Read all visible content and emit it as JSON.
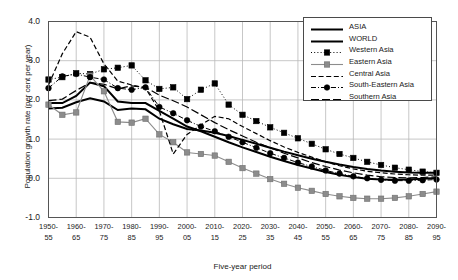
{
  "chart_data": {
    "type": "line",
    "title": "",
    "xlabel": "Five-year period",
    "ylabel": "Population growth rate (per cent per year)",
    "ylim": [
      -1.0,
      4.0
    ],
    "yticks": [
      -1.0,
      0.0,
      1.0,
      2.0,
      3.0,
      4.0
    ],
    "ytick_labels": [
      "-1.0",
      "0.0",
      "1.0",
      "2.0",
      "3.0",
      "4.0"
    ],
    "grid": true,
    "legend_position": "top-right",
    "categories": [
      "1950-55",
      "1955-60",
      "1960-65",
      "1965-70",
      "1970-75",
      "1975-80",
      "1980-85",
      "1985-90",
      "1990-95",
      "1995-00",
      "2000-05",
      "2005-10",
      "2010-15",
      "2015-20",
      "2020-25",
      "2025-30",
      "2030-35",
      "2035-40",
      "2040-45",
      "2045-50",
      "2050-55",
      "2055-60",
      "2060-65",
      "2065-70",
      "2070-75",
      "2075-80",
      "2080-85",
      "2085-90",
      "2090-95"
    ],
    "xtick_labels": [
      {
        "top": "1950-",
        "bottom": "55"
      },
      {
        "top": "1960-",
        "bottom": "65"
      },
      {
        "top": "1970-",
        "bottom": "75"
      },
      {
        "top": "1980-",
        "bottom": "85"
      },
      {
        "top": "1990-",
        "bottom": "95"
      },
      {
        "top": "2000-",
        "bottom": "05"
      },
      {
        "top": "2010-",
        "bottom": "15"
      },
      {
        "top": "2020-",
        "bottom": "25"
      },
      {
        "top": "2030-",
        "bottom": "35"
      },
      {
        "top": "2040-",
        "bottom": "45"
      },
      {
        "top": "2050-",
        "bottom": "55"
      },
      {
        "top": "2060-",
        "bottom": "65"
      },
      {
        "top": "2070-",
        "bottom": "75"
      },
      {
        "top": "2080-",
        "bottom": "85"
      },
      {
        "top": "2090-",
        "bottom": "95"
      }
    ],
    "series": [
      {
        "name": "ASIA",
        "style": "solid-thick",
        "color": "#000000",
        "marker": "none",
        "values": [
          1.92,
          1.92,
          2.1,
          2.44,
          2.35,
          1.96,
          1.92,
          1.92,
          1.72,
          1.52,
          1.32,
          1.2,
          1.06,
          0.92,
          0.79,
          0.67,
          0.55,
          0.44,
          0.34,
          0.25,
          0.16,
          0.09,
          0.03,
          -0.01,
          -0.03,
          -0.04,
          -0.03,
          -0.01,
          0.01
        ]
      },
      {
        "name": "WORLD",
        "style": "solid-thick",
        "color": "#000000",
        "marker": "none",
        "values": [
          1.78,
          1.8,
          1.94,
          2.04,
          1.96,
          1.74,
          1.78,
          1.76,
          1.52,
          1.38,
          1.26,
          1.22,
          1.16,
          1.08,
          0.98,
          0.88,
          0.78,
          0.68,
          0.59,
          0.5,
          0.42,
          0.35,
          0.29,
          0.24,
          0.2,
          0.17,
          0.15,
          0.14,
          0.14
        ]
      },
      {
        "name": "Western Asia",
        "style": "dotted",
        "color": "#000000",
        "marker": "square",
        "values": [
          2.52,
          2.58,
          2.68,
          2.66,
          2.78,
          2.82,
          2.88,
          2.5,
          2.28,
          2.32,
          2.02,
          2.26,
          2.42,
          1.88,
          1.62,
          1.46,
          1.3,
          1.16,
          1.02,
          0.88,
          0.74,
          0.62,
          0.52,
          0.42,
          0.34,
          0.27,
          0.22,
          0.17,
          0.14
        ]
      },
      {
        "name": "Eastern Asia",
        "style": "solid-gray",
        "color": "#8c8c8c",
        "marker": "square",
        "values": [
          1.88,
          1.62,
          1.68,
          2.62,
          2.22,
          1.44,
          1.42,
          1.52,
          1.12,
          0.92,
          0.66,
          0.62,
          0.58,
          0.42,
          0.26,
          0.12,
          -0.02,
          -0.14,
          -0.24,
          -0.32,
          -0.4,
          -0.46,
          -0.5,
          -0.52,
          -0.52,
          -0.5,
          -0.46,
          -0.4,
          -0.34
        ]
      },
      {
        "name": "Central Asia",
        "style": "dashed",
        "color": "#000000",
        "marker": "none",
        "values": [
          2.38,
          3.18,
          3.74,
          3.6,
          2.92,
          2.48,
          2.38,
          2.3,
          1.72,
          0.62,
          1.12,
          1.36,
          1.58,
          1.52,
          1.32,
          1.14,
          0.96,
          0.8,
          0.66,
          0.54,
          0.42,
          0.32,
          0.24,
          0.18,
          0.14,
          0.11,
          0.09,
          0.08,
          0.08
        ]
      },
      {
        "name": "South-Eastern Asia",
        "style": "dash-dot",
        "color": "#000000",
        "marker": "circle",
        "values": [
          2.3,
          2.6,
          2.66,
          2.58,
          2.52,
          2.3,
          2.26,
          2.32,
          1.82,
          1.66,
          1.48,
          1.32,
          1.2,
          1.06,
          0.92,
          0.78,
          0.64,
          0.52,
          0.4,
          0.3,
          0.2,
          0.12,
          0.05,
          0.0,
          -0.04,
          -0.06,
          -0.06,
          -0.05,
          -0.03
        ]
      },
      {
        "name": "Southern Asia",
        "style": "long-dash",
        "color": "#000000",
        "marker": "none",
        "values": [
          1.98,
          2.02,
          2.24,
          2.44,
          2.4,
          2.28,
          2.36,
          2.32,
          2.12,
          1.98,
          1.82,
          1.62,
          1.42,
          1.24,
          1.08,
          0.92,
          0.78,
          0.64,
          0.52,
          0.4,
          0.3,
          0.21,
          0.14,
          0.08,
          0.04,
          0.02,
          0.01,
          0.02,
          0.04
        ]
      }
    ]
  }
}
